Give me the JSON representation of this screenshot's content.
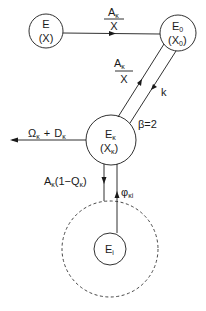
{
  "diagram": {
    "type": "compartment flow diagram",
    "colors": {
      "line": "#1a1a1a",
      "background": "#ffffff"
    },
    "nodes": {
      "E": {
        "name": "E",
        "sub": "",
        "content": "(X)",
        "content_sub": ""
      },
      "E0": {
        "name": "E",
        "sub": "0",
        "content": "(X",
        "content_sub": "0",
        "content_close": ")"
      },
      "Ek": {
        "name": "E",
        "sub": "κ",
        "content": "(X",
        "content_sub": "κ",
        "content_close": ")"
      },
      "Ei": {
        "name": "E",
        "sub": "i"
      }
    },
    "edges": {
      "E_to_E0": {
        "numerator": "A",
        "numerator_sub": "κ",
        "denominator": "X"
      },
      "Ek_to_E0": {
        "numerator": "A",
        "numerator_sub": "κ",
        "denominator": "X"
      },
      "E0_to_Ek": {
        "label": "k"
      },
      "beta": {
        "label": "β=2"
      },
      "Ek_out": {
        "part1": "Ω",
        "part1_sub": "κ",
        "plus": "+",
        "part2": "D",
        "part2_sub": "κ"
      },
      "Ek_to_Ei_region": {
        "prefix": "A",
        "prefix_sub": "κ",
        "body": "(1−Q",
        "body_sub": "κ",
        "close": ")"
      },
      "Ei_to_Ek": {
        "label": "φ",
        "label_sub": "κi"
      }
    }
  }
}
